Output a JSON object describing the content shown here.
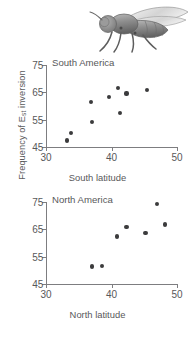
{
  "figure": {
    "illustration": "drosophila-fly-illustration",
    "y_axis_label_prefix": "Frequency of E",
    "y_axis_label_subscript": "st",
    "y_axis_label_suffix": " inversion"
  },
  "chart_data": [
    {
      "type": "scatter",
      "title": "South America",
      "xlabel": "South latitude",
      "ylabel": "Frequency of Est inversion",
      "xlim": [
        30,
        50
      ],
      "ylim": [
        45,
        75
      ],
      "xticks": [
        30,
        40,
        50
      ],
      "yticks": [
        45,
        55,
        65,
        75
      ],
      "grid": false,
      "legend": "none",
      "points": [
        {
          "x": 33.2,
          "y": 47.4
        },
        {
          "x": 33.8,
          "y": 50.0
        },
        {
          "x": 37.0,
          "y": 54.2
        },
        {
          "x": 36.9,
          "y": 61.5
        },
        {
          "x": 39.6,
          "y": 63.2
        },
        {
          "x": 41.0,
          "y": 66.6
        },
        {
          "x": 41.3,
          "y": 57.3
        },
        {
          "x": 42.3,
          "y": 64.6
        },
        {
          "x": 45.4,
          "y": 65.8
        }
      ]
    },
    {
      "type": "scatter",
      "title": "North America",
      "xlabel": "North latitude",
      "ylabel": "Frequency of Est inversion",
      "xlim": [
        30,
        50
      ],
      "ylim": [
        45,
        75
      ],
      "xticks": [
        30,
        40,
        50
      ],
      "yticks": [
        45,
        55,
        65,
        75
      ],
      "grid": false,
      "legend": "none",
      "points": [
        {
          "x": 37.0,
          "y": 51.4
        },
        {
          "x": 38.5,
          "y": 51.7
        },
        {
          "x": 40.8,
          "y": 62.4
        },
        {
          "x": 42.3,
          "y": 65.8
        },
        {
          "x": 45.2,
          "y": 63.6
        },
        {
          "x": 46.9,
          "y": 74.3
        },
        {
          "x": 48.2,
          "y": 66.8
        }
      ]
    }
  ]
}
